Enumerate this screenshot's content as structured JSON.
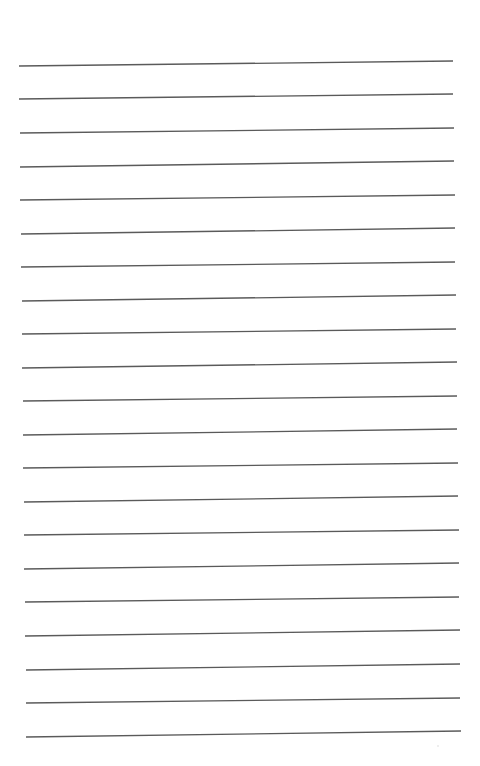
{
  "page": {
    "type": "ruled-paper",
    "background_color": "#ffffff",
    "line_color": "#5a5a5a",
    "line_count": 21,
    "lines": [
      {
        "x1": 19,
        "y1": 66,
        "x2": 453,
        "y2": 61
      },
      {
        "x1": 19,
        "y1": 99,
        "x2": 453,
        "y2": 94
      },
      {
        "x1": 20,
        "y1": 133,
        "x2": 454,
        "y2": 128
      },
      {
        "x1": 20,
        "y1": 167,
        "x2": 454,
        "y2": 161
      },
      {
        "x1": 20,
        "y1": 200,
        "x2": 455,
        "y2": 195
      },
      {
        "x1": 21,
        "y1": 234,
        "x2": 455,
        "y2": 228
      },
      {
        "x1": 21,
        "y1": 267,
        "x2": 455,
        "y2": 262
      },
      {
        "x1": 22,
        "y1": 301,
        "x2": 456,
        "y2": 295
      },
      {
        "x1": 22,
        "y1": 334,
        "x2": 456,
        "y2": 329
      },
      {
        "x1": 22,
        "y1": 368,
        "x2": 457,
        "y2": 362
      },
      {
        "x1": 23,
        "y1": 401,
        "x2": 457,
        "y2": 396
      },
      {
        "x1": 23,
        "y1": 435,
        "x2": 457,
        "y2": 429
      },
      {
        "x1": 23,
        "y1": 468,
        "x2": 458,
        "y2": 463
      },
      {
        "x1": 24,
        "y1": 502,
        "x2": 458,
        "y2": 496
      },
      {
        "x1": 24,
        "y1": 535,
        "x2": 459,
        "y2": 530
      },
      {
        "x1": 24,
        "y1": 569,
        "x2": 459,
        "y2": 563
      },
      {
        "x1": 25,
        "y1": 602,
        "x2": 459,
        "y2": 597
      },
      {
        "x1": 25,
        "y1": 636,
        "x2": 460,
        "y2": 630
      },
      {
        "x1": 26,
        "y1": 670,
        "x2": 460,
        "y2": 664
      },
      {
        "x1": 26,
        "y1": 703,
        "x2": 460,
        "y2": 698
      },
      {
        "x1": 26,
        "y1": 737,
        "x2": 461,
        "y2": 731
      }
    ],
    "text": ""
  }
}
